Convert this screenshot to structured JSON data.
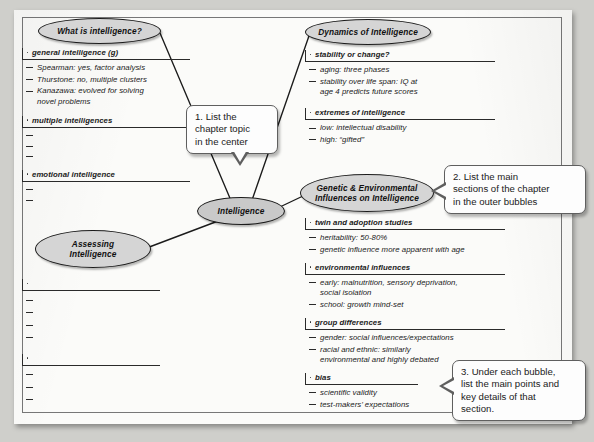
{
  "document": {
    "type": "mind-map-worksheet",
    "center_topic": "Intelligence"
  },
  "bubbles": [
    {
      "id": "what-is-intelligence",
      "label": "What is intelligence?"
    },
    {
      "id": "dynamics-of-intelligence",
      "label": "Dynamics of Intelligence"
    },
    {
      "id": "genetic-environmental",
      "label": "Genetic & Environmental\nInfluences on Intelligence"
    },
    {
      "id": "assessing-intelligence",
      "label": "Assessing\nIntelligence"
    },
    {
      "id": "center",
      "label": "Intelligence"
    }
  ],
  "bubble_labels": {
    "what_is_intelligence": "What is intelligence?",
    "dynamics_of_intelligence": "Dynamics of Intelligence",
    "genetic_line1": "Genetic & Environmental",
    "genetic_line2": "Influences on Intelligence",
    "assessing_line1": "Assessing",
    "assessing_line2": "Intelligence",
    "center": "Intelligence"
  },
  "outline": {
    "what_is_intelligence": [
      {
        "header": "general intelligence (g)",
        "subs": [
          {
            "text": "Spearman: yes, factor analysis"
          },
          {
            "text": "Thurstone: no, multiple clusters"
          },
          {
            "text": "Kanazawa: evolved for solving",
            "cont": "novel problems"
          }
        ]
      },
      {
        "header": "multiple intelligences",
        "subs": [
          {
            "text": ""
          },
          {
            "text": ""
          },
          {
            "text": ""
          }
        ]
      },
      {
        "header": "emotional intelligence",
        "subs": [
          {
            "text": ""
          },
          {
            "text": ""
          }
        ]
      }
    ],
    "assessing_intelligence": [
      {
        "header": "",
        "subs": [
          {
            "text": ""
          },
          {
            "text": ""
          },
          {
            "text": ""
          },
          {
            "text": ""
          }
        ]
      },
      {
        "header": "",
        "subs": [
          {
            "text": ""
          },
          {
            "text": ""
          },
          {
            "text": ""
          }
        ]
      }
    ],
    "dynamics_of_intelligence": [
      {
        "header": "stability or change?",
        "subs": [
          {
            "text": "aging: three phases"
          },
          {
            "text": "stability over life span: IQ at",
            "cont": "age 4 predicts future scores"
          }
        ]
      },
      {
        "header": "extremes of intelligence",
        "subs": [
          {
            "text": "low: intellectual disability"
          },
          {
            "text": "high: “gifted”"
          }
        ]
      }
    ],
    "genetic_environmental": [
      {
        "header": "twin and adoption studies",
        "subs": [
          {
            "text": "heritability: 50-80%"
          },
          {
            "text": "genetic influence more apparent with age"
          }
        ]
      },
      {
        "header": "environmental influences",
        "subs": [
          {
            "text": "early: malnutrition, sensory deprivation,",
            "cont": "social isolation"
          },
          {
            "text": "school: growth mind-set"
          }
        ]
      },
      {
        "header": "group differences",
        "subs": [
          {
            "text": "gender: social influences/expectations"
          },
          {
            "text": "racial and ethnic: similarly",
            "cont": "environmental and highly debated"
          }
        ]
      },
      {
        "header": "bias",
        "subs": [
          {
            "text": "scientific validity"
          },
          {
            "text": "test-makers’ expectations"
          }
        ]
      }
    ]
  },
  "callouts": [
    {
      "id": "callout-1",
      "text": "1. List the chapter topic in the center"
    },
    {
      "id": "callout-2",
      "text": "2. List the main sections of the chapter in the outer bubbles"
    },
    {
      "id": "callout-3",
      "text": "3. Under each bubble, list the main points and key details of that section."
    }
  ],
  "callout_lines": {
    "one": [
      "1. List the",
      "chapter topic",
      "in the center"
    ],
    "two": [
      "2. List the main",
      "sections of the chapter",
      "in the outer bubbles"
    ],
    "three": [
      "3. Under each bubble,",
      "list the main points and",
      "key details of that",
      "section."
    ]
  },
  "colors": {
    "page": "#fbfbf9",
    "bubble_fill": "#d5d5d5",
    "ink": "#1a1a1a",
    "callout_border": "#5f5f5f",
    "backdrop": "#cfcfcb"
  }
}
